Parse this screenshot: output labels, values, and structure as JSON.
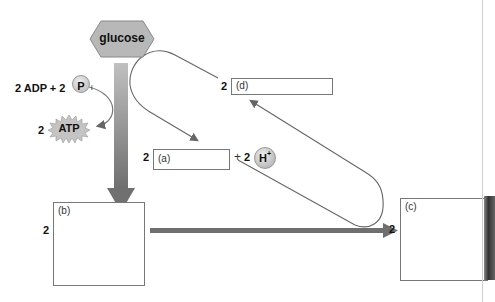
{
  "diagram": {
    "glucose": {
      "label": "glucose",
      "fill": "#b8b8b8"
    },
    "inputs": {
      "text": "2 ADP + 2",
      "phosphate_symbol": "P",
      "phosphate_subscript": "i"
    },
    "atp": {
      "coefficient": "2",
      "label": "ATP"
    },
    "box_a": {
      "coefficient": "2",
      "label": "(a)"
    },
    "hydrogen": {
      "plus": "+",
      "coefficient": "2",
      "label": "H",
      "superscript": "+"
    },
    "box_b": {
      "coefficient": "2",
      "label": "(b)"
    },
    "box_c": {
      "coefficient": "2",
      "label": "(c)"
    },
    "box_d": {
      "coefficient": "2",
      "label": "(d)"
    },
    "colors": {
      "arrow_main": "#6f6f6f",
      "loop_line": "#666666",
      "box_border": "#777777"
    }
  }
}
